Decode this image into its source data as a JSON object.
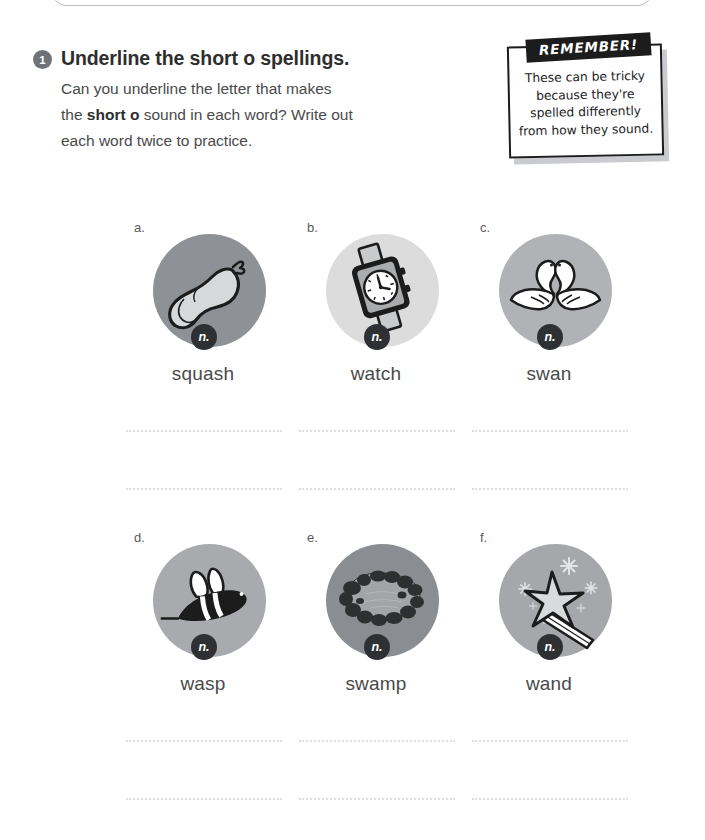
{
  "worksheet": {
    "question_number": "1",
    "title": "Underline the short o spellings.",
    "instruction_line1": "Can you underline the letter that makes",
    "instruction_line2_pre": "the ",
    "instruction_line2_bold": "short o",
    "instruction_line2_post": " sound in each word? Write out",
    "instruction_line3": "each word twice to practice."
  },
  "remember": {
    "banner": "REMEMBER!",
    "line1": "These can be tricky",
    "line2": "because they're",
    "line3": "spelled differently",
    "line4": "from how they sound."
  },
  "items": [
    {
      "letter": "a.",
      "word": "squash",
      "pos": "n.",
      "icon": "squash-icon",
      "circle_color": "#8e9196"
    },
    {
      "letter": "b.",
      "word": "watch",
      "pos": "n.",
      "icon": "watch-icon",
      "circle_color": "#dcdcdc"
    },
    {
      "letter": "c.",
      "word": "swan",
      "pos": "n.",
      "icon": "swan-icon",
      "circle_color": "#b0b2b5"
    },
    {
      "letter": "d.",
      "word": "wasp",
      "pos": "n.",
      "icon": "wasp-icon",
      "circle_color": "#a8aaad"
    },
    {
      "letter": "e.",
      "word": "swamp",
      "pos": "n.",
      "icon": "swamp-icon",
      "circle_color": "#8a8d91"
    },
    {
      "letter": "f.",
      "word": "wand",
      "pos": "n.",
      "icon": "wand-icon",
      "circle_color": "#a5a7ab"
    }
  ],
  "colors": {
    "badge_dark": "#2f3033",
    "number_badge": "#6f7377",
    "line_dots": "#dddfe3",
    "text": "#4a4a4a",
    "heading": "#2e2e2e"
  }
}
